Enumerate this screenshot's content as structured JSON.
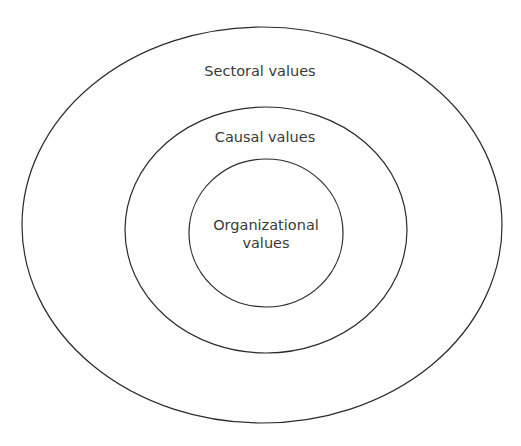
{
  "diagram": {
    "type": "nested-ellipses",
    "layers": [
      {
        "label": "Sectoral values",
        "level": "outer"
      },
      {
        "label": "Causal values",
        "level": "middle"
      },
      {
        "label_line1": "Organizational",
        "label_line2": "values",
        "level": "inner"
      }
    ],
    "colors": {
      "stroke": "#2a2a2a",
      "text": "#3a3a3a",
      "background": "#ffffff"
    }
  }
}
